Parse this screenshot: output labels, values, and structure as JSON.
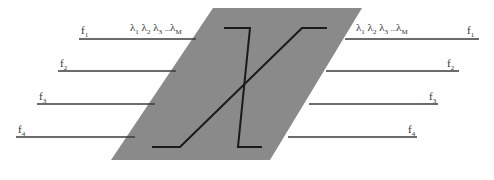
{
  "diagram": {
    "type": "optical-cross-connect",
    "colors": {
      "switch_fill": "#8a8a8a",
      "fiber_line": "#3a3a3a",
      "path_line": "#1a1a1a",
      "label": "#333333"
    },
    "switch": {
      "shape": "parallelogram",
      "corners": [
        [
          213,
          8
        ],
        [
          362,
          8
        ],
        [
          270,
          160
        ],
        [
          111,
          160
        ]
      ]
    },
    "wavelengths": {
      "left": {
        "l1": "λ",
        "s1": "1",
        "l2": "λ",
        "s2": "2",
        "l3": "λ",
        "s3": "3",
        "dots": "...",
        "lM": "λ",
        "sM": "M"
      },
      "right": {
        "l1": "λ",
        "s1": "1",
        "l2": "λ",
        "s2": "2",
        "l3": "λ",
        "s3": "3",
        "dots": "...",
        "lM": "λ",
        "sM": "M"
      }
    },
    "input_fibers": [
      {
        "label": "f",
        "sub": "1",
        "y": 39,
        "x1": 79,
        "x2": 196
      },
      {
        "label": "f",
        "sub": "2",
        "y": 71,
        "x1": 58,
        "x2": 176
      },
      {
        "label": "f",
        "sub": "3",
        "y": 104,
        "x1": 37,
        "x2": 155
      },
      {
        "label": "f",
        "sub": "4",
        "y": 137,
        "x1": 16,
        "x2": 135
      }
    ],
    "output_fibers": [
      {
        "label": "f",
        "sub": "1",
        "y": 39,
        "x1": 345,
        "x2": 479
      },
      {
        "label": "f",
        "sub": "2",
        "y": 71,
        "x1": 326,
        "x2": 459
      },
      {
        "label": "f",
        "sub": "3",
        "y": 104,
        "x1": 309,
        "x2": 438
      },
      {
        "label": "f",
        "sub": "4",
        "y": 137,
        "x1": 288,
        "x2": 417
      }
    ]
  }
}
